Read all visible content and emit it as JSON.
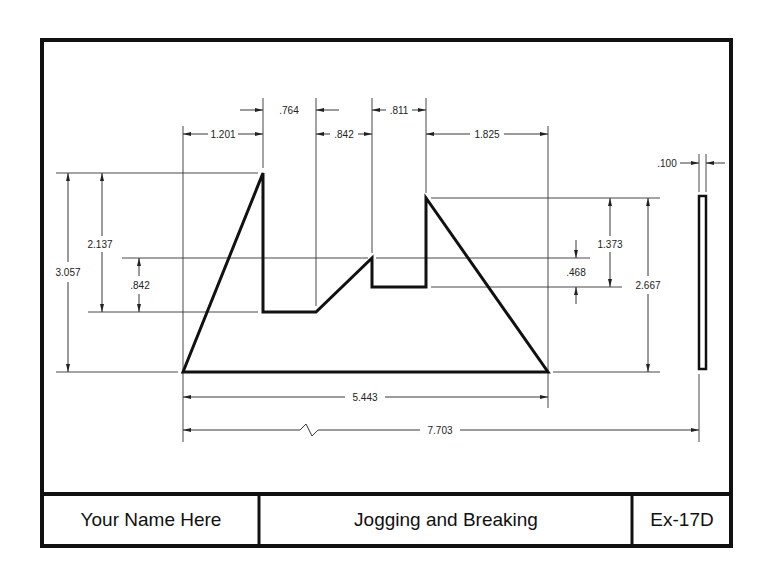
{
  "title_block": {
    "name": "Your Name Here",
    "title": "Jogging and Breaking",
    "exercise": "Ex-17D"
  },
  "dimensions": {
    "horizontal": {
      "d1201": "1.201",
      "d764": ".764",
      "d842": ".842",
      "d811": ".811",
      "d1825": "1.825",
      "d5443": "5.443",
      "d7703": "7.703",
      "d100": ".100"
    },
    "vertical": {
      "d3057": "3.057",
      "d2137": "2.137",
      "d842": ".842",
      "d1373": "1.373",
      "d468": ".468",
      "d2667": "2.667"
    }
  },
  "colors": {
    "line": "#111111",
    "thin_line": "#333333",
    "background": "#ffffff"
  }
}
